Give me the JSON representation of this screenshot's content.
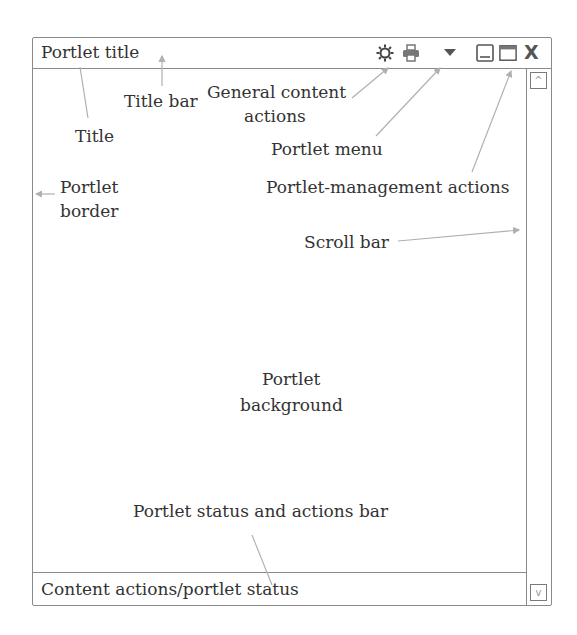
{
  "portlet": {
    "title": "Portlet title",
    "status_text": "Content actions/portlet status",
    "icons": [
      "gear-icon",
      "printer-icon",
      "menu-dropdown-icon",
      "minimize-icon",
      "maximize-icon",
      "close-icon"
    ],
    "close_glyph": "X",
    "scroll_up_glyph": "^",
    "scroll_down_glyph": "v"
  },
  "annotations": {
    "title_bar": "Title bar",
    "title": "Title",
    "general_content_actions_1": "General content",
    "general_content_actions_2": "actions",
    "portlet_menu": "Portlet menu",
    "portlet_border_1": "Portlet",
    "portlet_border_2": "border",
    "portlet_management_actions": "Portlet-management actions",
    "scroll_bar": "Scroll bar",
    "portlet_background_1": "Portlet",
    "portlet_background_2": "background",
    "status_and_actions_bar": "Portlet status and actions bar"
  },
  "colors": {
    "border": "#8a8a8a",
    "text": "#333333",
    "arrow": "#b0b0b0",
    "icon": "#555555"
  }
}
